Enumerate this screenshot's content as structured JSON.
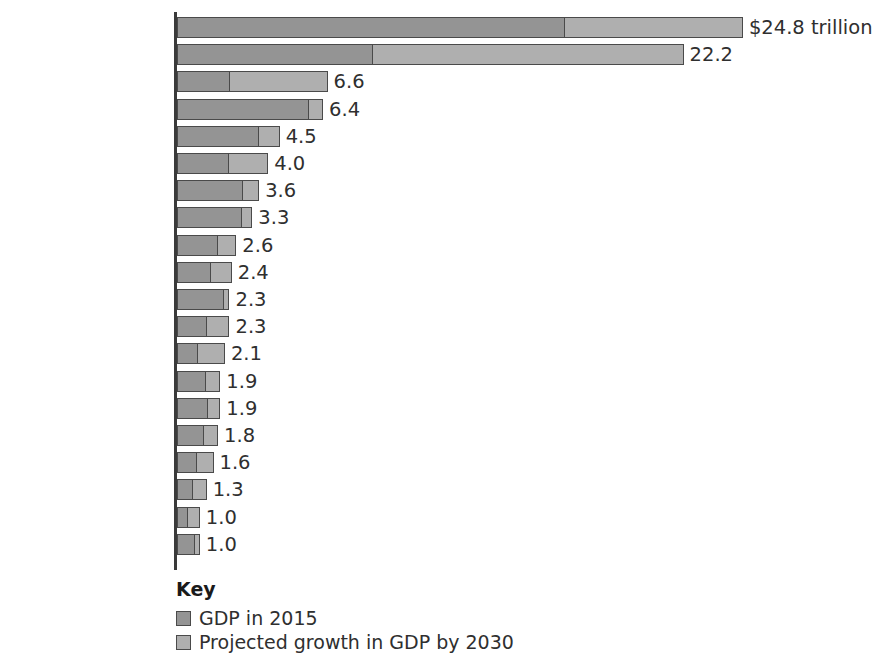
{
  "chart_data": {
    "type": "bar",
    "subtype": "stacked-horizontal",
    "title": "",
    "xlabel": "",
    "ylabel": "",
    "unit": "trillion US dollars",
    "xlim": [
      0,
      24.8
    ],
    "grid": false,
    "legend_position": "bottom-left",
    "legend_title": "Key",
    "categories": [
      "United States",
      "China",
      "India",
      "Japan",
      "Germany",
      "Brazil",
      "United Kingdom",
      "France",
      "Canada",
      "Russia",
      "Italy",
      "Mexico",
      "Indonesia",
      "Australia",
      "South Korea",
      "Spain",
      "Turkey",
      "Saudi Arabia",
      "Nigeria",
      "Netherlands"
    ],
    "series": [
      {
        "name": "GDP in 2015",
        "color": "#949494",
        "values": [
          17.0,
          8.6,
          2.3,
          5.8,
          3.6,
          2.3,
          2.9,
          2.9,
          1.8,
          1.5,
          2.1,
          1.3,
          0.9,
          1.3,
          1.4,
          1.2,
          0.9,
          0.7,
          0.5,
          0.8
        ]
      },
      {
        "name": "Projected growth in GDP by 2030",
        "color": "#afafaf",
        "values": [
          7.8,
          13.6,
          4.3,
          0.6,
          0.9,
          1.7,
          0.7,
          0.4,
          0.8,
          0.9,
          0.2,
          1.0,
          1.2,
          0.6,
          0.5,
          0.6,
          0.7,
          0.6,
          0.5,
          0.2
        ]
      }
    ],
    "totals": [
      24.8,
      22.2,
      6.6,
      6.4,
      4.5,
      4.0,
      3.6,
      3.3,
      2.6,
      2.4,
      2.3,
      2.3,
      2.1,
      1.9,
      1.9,
      1.8,
      1.6,
      1.3,
      1.0,
      1.0
    ],
    "value_labels": [
      "$24.8 trillion",
      "22.2",
      "6.6",
      "6.4",
      "4.5",
      "4.0",
      "3.6",
      "3.3",
      "2.6",
      "2.4",
      "2.3",
      "2.3",
      "2.1",
      "1.9",
      "1.9",
      "1.8",
      "1.6",
      "1.3",
      "1.0",
      "1.0"
    ]
  },
  "legend": {
    "title": "Key",
    "items": [
      {
        "label": "GDP in 2015",
        "color": "#949494"
      },
      {
        "label": "Projected growth in GDP by 2030",
        "color": "#afafaf"
      }
    ]
  },
  "colors": {
    "base_segment": "#949494",
    "growth_segment": "#afafaf",
    "outline": "#4a4a4a",
    "axis": "#3a3a3a",
    "category_text": "#3f3f3f",
    "value_text": "#2f2f2f",
    "legend_title_text": "#1a1a1a",
    "background": "#ffffff"
  }
}
